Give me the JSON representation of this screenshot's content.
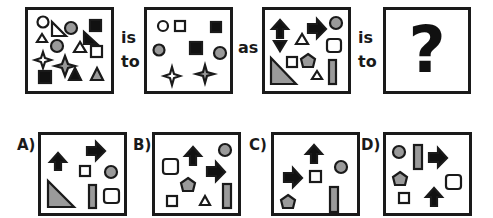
{
  "puzzle": {
    "connector_is": "is",
    "connector_to": "to",
    "connector_as": "as",
    "unknown_symbol": "?"
  },
  "colors": {
    "black": "#111111",
    "gray": "#9a9a9a",
    "white": "#ffffff",
    "stroke": "#1a1a1a"
  },
  "panels": {
    "source_a": {
      "description": "Mixed shapes: circles, triangles, squares, stars",
      "shapes": [
        "white circle",
        "white triangle (small)",
        "white right triangle",
        "gray circle",
        "black square",
        "black right triangle",
        "gray circle",
        "white triangle",
        "white square",
        "white star",
        "gray star",
        "black square",
        "black triangle",
        "gray triangle"
      ]
    },
    "result_a": {
      "description": "Triangles removed",
      "shapes": [
        "white circle",
        "white square",
        "black square",
        "gray circle",
        "black square",
        "gray circle",
        "white star",
        "gray star"
      ]
    },
    "source_b": {
      "description": "Arrows, triangles, squares, pentagon, bar, circle",
      "shapes": [
        "black up arrow",
        "black down arrow",
        "black right arrow",
        "gray circle",
        "white triangle",
        "white rounded square",
        "white square",
        "gray pentagon",
        "gray right triangle",
        "white triangle (small)",
        "gray bar"
      ]
    },
    "result_b": {
      "description": "Unknown"
    }
  },
  "options": [
    {
      "label": "A)",
      "shapes": [
        "black up arrow",
        "black right arrow",
        "white square",
        "gray circle",
        "gray right triangle",
        "gray bar",
        "white rounded square"
      ]
    },
    {
      "label": "B)",
      "shapes": [
        "black up arrow",
        "gray circle",
        "white rounded square",
        "black right arrow",
        "gray pentagon",
        "white square",
        "white triangle",
        "gray bar"
      ]
    },
    {
      "label": "C)",
      "shapes": [
        "black up arrow",
        "black right arrow",
        "white square",
        "gray circle",
        "gray pentagon",
        "gray bar"
      ]
    },
    {
      "label": "D)",
      "shapes": [
        "gray circle",
        "gray bar",
        "black right arrow",
        "gray pentagon",
        "white rounded square",
        "white square",
        "black up arrow"
      ]
    }
  ]
}
